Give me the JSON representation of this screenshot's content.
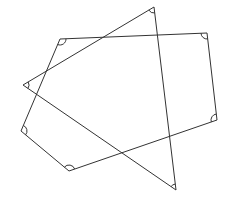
{
  "diagram": {
    "width": 231,
    "height": 203,
    "background": "#ffffff",
    "stroke_color": "#333333",
    "stroke_width": 1,
    "arc_radius": 6,
    "shapes": [
      {
        "name": "pentagon",
        "points": [
          [
            60,
            39
          ],
          [
            207,
            33
          ],
          [
            217,
            120
          ],
          [
            69,
            171
          ],
          [
            21,
            131
          ]
        ]
      },
      {
        "name": "triangle",
        "points": [
          [
            154,
            7
          ],
          [
            176,
            190
          ],
          [
            23,
            85
          ]
        ]
      }
    ]
  }
}
